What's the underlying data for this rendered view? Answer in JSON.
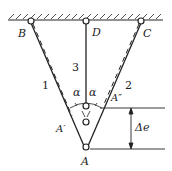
{
  "diagram": {
    "points": {
      "B": "B",
      "D": "D",
      "C": "C",
      "A": "A",
      "A_prime": "A′",
      "A_double_prime": "A″"
    },
    "members": {
      "bar1": "1",
      "bar2": "2",
      "bar3": "3"
    },
    "angles": {
      "left": "α",
      "right": "α"
    },
    "dimension": {
      "label": "Δe"
    },
    "colors": {
      "line": "#222222",
      "background": "#ffffff"
    }
  }
}
